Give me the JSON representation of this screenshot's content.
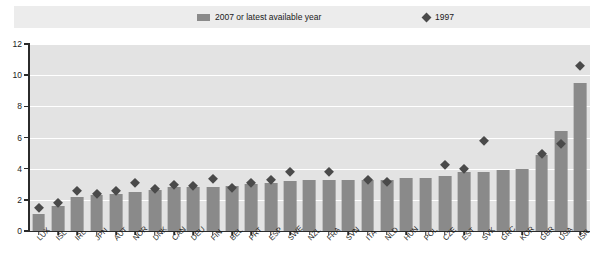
{
  "legend": {
    "bars_label": "2007 or latest available year",
    "diamond_label": "1997",
    "bar_icon": "bar-swatch-icon",
    "diamond_icon": "diamond-swatch-icon"
  },
  "axis": {
    "y_ticks": [
      "0",
      "2",
      "4",
      "6",
      "8",
      "10",
      "12"
    ]
  },
  "colors": {
    "bar": "#8a8a8a",
    "diamond": "#4a4a4a",
    "plot_background": "#e3e3e3",
    "legend_background": "#ececec",
    "axis": "#2b2b2b",
    "gridline": "#ffffff"
  },
  "chart_data": {
    "type": "bar",
    "title": "",
    "subtitle": "",
    "xlabel": "",
    "ylabel": "",
    "ylim": [
      0,
      12
    ],
    "yticks": [
      0,
      2,
      4,
      6,
      8,
      10,
      12
    ],
    "grid": true,
    "legend_position": "top",
    "categories": [
      "LUX",
      "ISL",
      "IRL",
      "JPN",
      "AUT",
      "NOR",
      "DNK",
      "CAN",
      "DEU",
      "FIN",
      "BEL",
      "PRT",
      "ESP",
      "SWE",
      "NZL",
      "FRA",
      "SVN",
      "ITA",
      "NLD",
      "HUN",
      "POL",
      "CZE",
      "EST",
      "SVK",
      "GRC",
      "KOR",
      "GBR",
      "USA",
      "ISR"
    ],
    "series": [
      {
        "name": "2007 or latest available year",
        "type": "bar",
        "values": [
          1.1,
          1.6,
          2.2,
          2.3,
          2.4,
          2.5,
          2.6,
          2.8,
          2.8,
          2.8,
          2.9,
          3.0,
          3.1,
          3.2,
          3.3,
          3.3,
          3.3,
          3.3,
          3.3,
          3.4,
          3.4,
          3.5,
          3.8,
          3.8,
          3.9,
          4.0,
          4.9,
          6.4,
          9.5
        ]
      },
      {
        "name": "1997",
        "type": "scatter",
        "values": [
          1.5,
          1.8,
          2.6,
          2.4,
          2.6,
          3.1,
          2.7,
          3.0,
          2.9,
          3.4,
          2.8,
          3.1,
          3.3,
          3.8,
          null,
          3.8,
          null,
          3.3,
          3.2,
          null,
          null,
          4.3,
          4.0,
          5.8,
          null,
          null,
          5.0,
          5.6,
          10.6
        ]
      }
    ]
  }
}
